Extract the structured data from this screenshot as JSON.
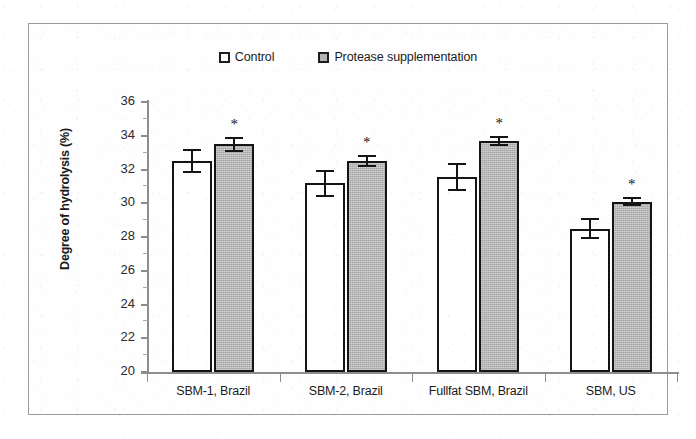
{
  "chart_data": {
    "type": "bar",
    "title": "",
    "xlabel": "",
    "ylabel": "Degree of hydrolysis (%)",
    "ylim": [
      20,
      36
    ],
    "ytick_step": 2,
    "yticks": [
      "20",
      "22",
      "24",
      "26",
      "28",
      "30",
      "32",
      "34",
      "36"
    ],
    "grid": false,
    "legend_position": "top-center",
    "categories": [
      "SBM-1, Brazil",
      "SBM-2, Brazil",
      "Fullfat SBM, Brazil",
      "SBM, US"
    ],
    "series": [
      {
        "name": "Control",
        "fill": "#ffffff",
        "values": [
          32.5,
          31.2,
          31.55,
          28.5
        ],
        "errors": [
          0.7,
          0.8,
          0.85,
          0.6
        ],
        "significant": [
          false,
          false,
          false,
          false
        ]
      },
      {
        "name": "Protease supplementation",
        "fill": "#b5b5b5",
        "values": [
          33.5,
          32.5,
          33.7,
          30.1
        ],
        "errors": [
          0.45,
          0.35,
          0.3,
          0.25
        ],
        "significant": [
          true,
          true,
          true,
          true
        ]
      }
    ],
    "significance_marker": "*",
    "annotations": [
      "* indicates significant difference from control"
    ]
  },
  "legend": {
    "entries": [
      {
        "label": "Control",
        "swatch": "control"
      },
      {
        "label": "Protease supplementation",
        "swatch": "protease"
      }
    ]
  },
  "colors": {
    "control_fill": "#ffffff",
    "protease_fill": "#b5b5b5",
    "bar_outline": "#141414",
    "axis": "#8d8d8d",
    "frame": "#9a9a9a",
    "text": "#1b1b1b"
  }
}
